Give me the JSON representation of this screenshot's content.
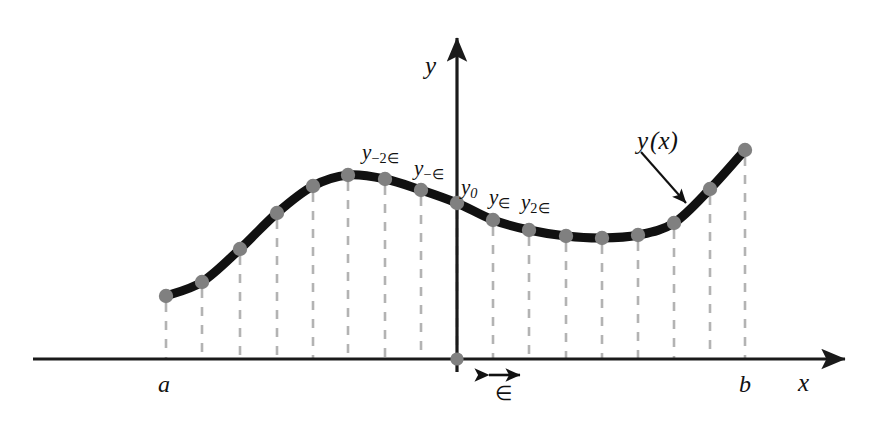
{
  "figure": {
    "background_color": "#ffffff",
    "curve_color": "#111111",
    "point_color": "#808080",
    "dash_color": "#b3b3b3",
    "axis_color": "#1a1a1a"
  },
  "axes": {
    "x_label": "x",
    "y_label": "y",
    "x_axis": {
      "x1": 33,
      "x2": 850,
      "y": 359
    },
    "y_axis": {
      "x": 457,
      "y1": 32,
      "y2": 372
    }
  },
  "endpoints": {
    "left_label": "a",
    "right_label": "b"
  },
  "function_label": {
    "text_y": "y",
    "text_arg": "(x)"
  },
  "spacing_marker": {
    "symbol": "∈",
    "arrow_x1": 488,
    "arrow_x2": 521,
    "arrow_y": 375
  },
  "point_labels": [
    {
      "id": "y-minus-2eps",
      "base": "y",
      "sub": "−2∈",
      "x": 362,
      "y": 142
    },
    {
      "id": "y-minus-eps",
      "base": "y",
      "sub": "−∈",
      "x": 414,
      "y": 158
    },
    {
      "id": "y-zero",
      "base": "y",
      "sub": "0",
      "x": 461,
      "y": 177
    },
    {
      "id": "y-plus-eps",
      "base": "y",
      "sub": "∈",
      "x": 489,
      "y": 187
    },
    {
      "id": "y-plus-2eps",
      "base": "y",
      "sub": "2∈",
      "x": 521,
      "y": 192
    }
  ],
  "chart_data": {
    "type": "line",
    "xlabel": "x",
    "ylabel": "y",
    "grid": false,
    "legend": null,
    "annotations": [
      "y(x)",
      "a",
      "b",
      "∈"
    ],
    "axis_origin_px": {
      "x": 457,
      "y": 359
    },
    "sample_labels": [
      null,
      null,
      null,
      null,
      null,
      null,
      "y_{-2∈}",
      "y_{-∈}",
      "y_0",
      "y_{∈}",
      "y_{2∈}",
      null,
      null,
      null,
      null,
      null,
      null
    ],
    "points_px": [
      {
        "x": 166,
        "y": 296
      },
      {
        "x": 202,
        "y": 282
      },
      {
        "x": 240,
        "y": 249
      },
      {
        "x": 277,
        "y": 213
      },
      {
        "x": 313,
        "y": 186
      },
      {
        "x": 348,
        "y": 175
      },
      {
        "x": 385,
        "y": 179
      },
      {
        "x": 421,
        "y": 190
      },
      {
        "x": 457,
        "y": 203
      },
      {
        "x": 493,
        "y": 220
      },
      {
        "x": 529,
        "y": 230
      },
      {
        "x": 566,
        "y": 236
      },
      {
        "x": 602,
        "y": 238
      },
      {
        "x": 638,
        "y": 235
      },
      {
        "x": 674,
        "y": 223
      },
      {
        "x": 710,
        "y": 189
      },
      {
        "x": 745,
        "y": 150
      }
    ],
    "x_values": [
      -8,
      -7,
      -6,
      -5,
      -4,
      -3,
      -2,
      -1,
      0,
      1,
      2,
      3,
      4,
      5,
      6,
      7,
      8
    ],
    "x_unit": "∈",
    "y_values": [
      63,
      77,
      110,
      146,
      173,
      184,
      180,
      169,
      156,
      139,
      129,
      123,
      121,
      124,
      136,
      170,
      209
    ],
    "xlim": [
      -8,
      8
    ],
    "ylim": [
      0,
      220
    ]
  }
}
